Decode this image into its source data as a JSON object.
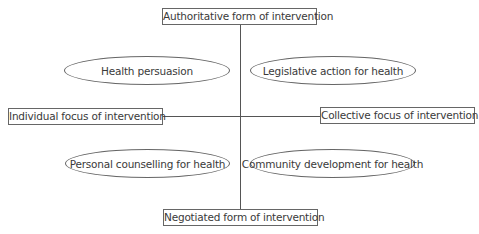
{
  "diagram": {
    "axes": {
      "top": "Authoritative form of intervention",
      "bottom": "Negotiated form of intervention",
      "left": "Individual focus of intervention",
      "right": "Collective focus of intervention"
    },
    "quadrants": {
      "top_left": "Health persuasion",
      "top_right": "Legislative action for health",
      "bottom_left": "Personal counselling for health",
      "bottom_right": "Community development for health"
    },
    "colors": {
      "line": "#555555",
      "border": "#666666",
      "text": "#3a3a3a"
    }
  }
}
